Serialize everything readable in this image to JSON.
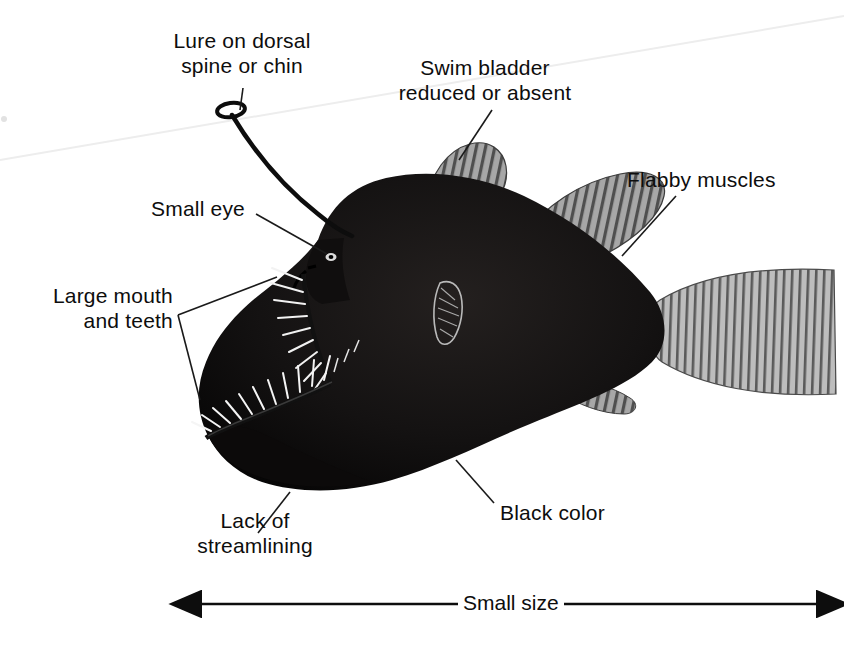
{
  "figure": {
    "background_color": "#ffffff",
    "ink_color": "#0d0d0d",
    "body_color": "#111111",
    "fin_color": "#8f8f8f"
  },
  "labels": {
    "lure": "Lure on dorsal\nspine or chin",
    "swim_bladder": "Swim bladder\nreduced or absent",
    "flabby_muscles": "Flabby muscles",
    "small_eye": "Small eye",
    "large_mouth": "Large mouth\nand teeth",
    "lack_streamlining": "Lack of\nstreamlining",
    "black_color": "Black color",
    "small_size": "Small size"
  },
  "callouts": [
    {
      "name": "lure",
      "text": "Lure on dorsal spine or chin",
      "target": "illicium tip (esca)"
    },
    {
      "name": "swim-bladder",
      "text": "Swim bladder reduced or absent",
      "target": "first dorsal fin / body cavity"
    },
    {
      "name": "flabby-muscles",
      "text": "Flabby muscles",
      "target": "second dorsal fin"
    },
    {
      "name": "small-eye",
      "text": "Small eye",
      "target": "eye on head"
    },
    {
      "name": "large-mouth",
      "text": "Large mouth and teeth",
      "target": "upper and lower jaws"
    },
    {
      "name": "lack-of-streamlining",
      "text": "Lack of streamlining",
      "target": "ventral body contour"
    },
    {
      "name": "black-color",
      "text": "Black color",
      "target": "flank of body"
    }
  ],
  "scale_bar": {
    "label": "Small size",
    "style": "double-headed arrow",
    "left_x": 200,
    "right_x": 818,
    "y": 604
  }
}
